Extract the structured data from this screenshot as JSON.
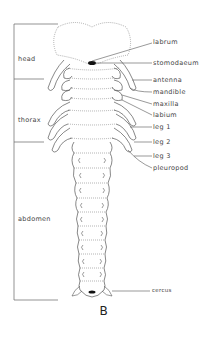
{
  "diagram": {
    "caption": "B",
    "regions": [
      {
        "label": "head"
      },
      {
        "label": "thorax"
      },
      {
        "label": "abdomen"
      }
    ],
    "labels": [
      {
        "label": "labrum"
      },
      {
        "label": "stomodaeum"
      },
      {
        "label": "antenna"
      },
      {
        "label": "mandible"
      },
      {
        "label": "maxilla"
      },
      {
        "label": "labium"
      },
      {
        "label": "leg 1"
      },
      {
        "label": "leg 2"
      },
      {
        "label": "leg 3"
      },
      {
        "label": "pleuropod"
      },
      {
        "label": "cercus"
      }
    ],
    "colors": {
      "line": "#555555",
      "dotted": "#777777",
      "fill": "#111111"
    }
  }
}
